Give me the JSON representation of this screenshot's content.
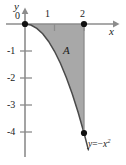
{
  "figure": {
    "axes": {
      "x_axis_label": "x",
      "y_axis_label": "y",
      "origin_label": "0",
      "x_ticks": [
        "1",
        "2"
      ],
      "y_ticks": [
        "-1",
        "-2",
        "-3",
        "-4"
      ]
    },
    "region_label": "A",
    "curve_label": {
      "lhs": "y",
      "equals": "=",
      "sign": "−",
      "base": "x",
      "exponent": "2"
    },
    "colors": {
      "fill": "#a8a8a8",
      "axis": "#8c8c8c",
      "curve": "#4a4a4a",
      "text": "#1a1a1a",
      "point": "#111111",
      "background": "#ffffff"
    }
  },
  "chart_data": {
    "type": "line",
    "title": "",
    "xlabel": "x",
    "ylabel": "y",
    "xlim": [
      -0.3,
      3.4
    ],
    "ylim": [
      -4.9,
      0.5
    ],
    "grid": false,
    "legend": null,
    "series": [
      {
        "name": "y = -x^2",
        "equation": "y = -x^2",
        "x": [
          0,
          0.2,
          0.4,
          0.6,
          0.8,
          1.0,
          1.2,
          1.4,
          1.6,
          1.8,
          2.0
        ],
        "values": [
          0,
          -0.04,
          -0.16,
          -0.36,
          -0.64,
          -1.0,
          -1.44,
          -1.96,
          -2.56,
          -3.24,
          -4.0
        ]
      }
    ],
    "shaded_region": {
      "label": "A",
      "description": "Area between y = -x^2 and the x-axis from x = 0 to x = 2",
      "x_from": 0,
      "x_to": 2,
      "upper_bound": "y = 0",
      "lower_bound": "y = -x^2",
      "area": 2.667
    },
    "marked_points": [
      {
        "x": 0,
        "y": 0
      },
      {
        "x": 2,
        "y": 0
      },
      {
        "x": 2,
        "y": -4
      }
    ],
    "x_tick_values": [
      1,
      2
    ],
    "x_tick_labels": [
      "1",
      "2"
    ],
    "y_tick_values": [
      -1,
      -2,
      -3,
      -4
    ],
    "y_tick_labels": [
      "-1",
      "-2",
      "-3",
      "-4"
    ]
  }
}
